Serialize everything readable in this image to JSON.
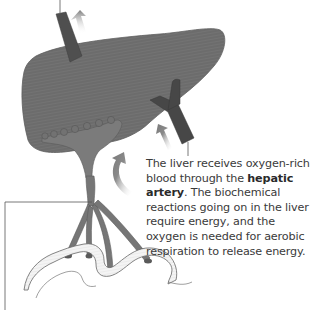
{
  "figure": {
    "subject": "liver",
    "labels": {
      "hepatic_artery": "hepatic artery"
    },
    "caption": {
      "part1": "The liver receives oxygen-rich blood through the ",
      "bold": "hepatic artery",
      "part2": ". The biochemical reactions going on in the liver require energy, and the oxygen is needed for aerobic respiration to release energy."
    },
    "colors": {
      "liver": "#6e6e6e",
      "liver_stripe": "#7a7a7a",
      "vessel_dark": "#4a4a4a",
      "portal_vein": "#787878",
      "intestine": "#f2f2f2",
      "arrow": "#8a8a8a",
      "text": "#3a3a3a",
      "leader_line": "#555555"
    }
  }
}
